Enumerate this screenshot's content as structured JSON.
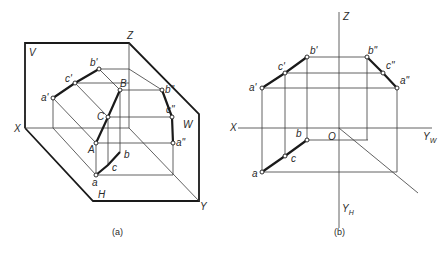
{
  "figure_a": {
    "caption": "(a)",
    "planes": {
      "V": "V",
      "W": "W",
      "H": "H"
    },
    "axes": {
      "X": "X",
      "Y": "Y",
      "Z": "Z"
    },
    "points": {
      "A": "A",
      "B": "B",
      "C": "C",
      "a_prime": "a'",
      "b_prime": "b'",
      "c_prime": "c'",
      "a_dprime": "a\"",
      "b_dprime": "b\"",
      "c_dprime": "c\"",
      "a": "a",
      "b": "b",
      "c": "c"
    }
  },
  "figure_b": {
    "caption": "(b)",
    "axes": {
      "X": "X",
      "Z": "Z",
      "O": "O",
      "Y_W": "Y",
      "Y_W_sub": "W",
      "Y_H": "Y",
      "Y_H_sub": "H"
    },
    "points": {
      "a_prime": "a'",
      "b_prime": "b'",
      "c_prime": "c'",
      "a_dprime": "a\"",
      "b_dprime": "b\"",
      "c_dprime": "c\"",
      "a": "a",
      "b": "b",
      "c": "c"
    }
  }
}
